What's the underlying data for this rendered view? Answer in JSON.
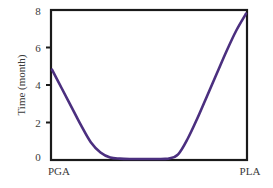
{
  "chart_data": {
    "type": "line",
    "title": "",
    "xlabel": "",
    "ylabel": "Time (month)",
    "ylim": [
      0,
      8
    ],
    "yticks": [
      0,
      2,
      4,
      6,
      8
    ],
    "xtick_labels": [
      "PGA",
      "PLA"
    ],
    "x": [
      0,
      0.05,
      0.1,
      0.15,
      0.2,
      0.25,
      0.3,
      0.35,
      0.4,
      0.45,
      0.5,
      0.55,
      0.6,
      0.65,
      0.7,
      0.75,
      0.8,
      0.85,
      0.9,
      0.95,
      1.0
    ],
    "series": [
      {
        "name": "Time",
        "color": "#4b2f7f",
        "values": [
          4.8,
          3.8,
          2.8,
          1.8,
          0.9,
          0.35,
          0.08,
          0.02,
          0.0,
          0.0,
          0.0,
          0.0,
          0.02,
          0.25,
          1.1,
          2.2,
          3.4,
          4.6,
          5.8,
          6.9,
          7.8
        ]
      }
    ],
    "grid": false,
    "legend": false,
    "frame": "box"
  },
  "axis": {
    "ylabel": "Time (month)",
    "yticks": [
      "0",
      "2",
      "4",
      "6",
      "8"
    ],
    "x_left_label": "PGA",
    "x_right_label": "PLA"
  },
  "colors": {
    "curve": "#4b2f7f",
    "frame": "#1a1a1a",
    "text": "#3a3a3a"
  }
}
